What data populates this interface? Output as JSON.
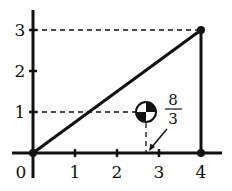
{
  "diagram": {
    "type": "triangle-center-of-mass",
    "x_axis": {
      "ticks": [
        "0",
        "1",
        "2",
        "3",
        "4"
      ]
    },
    "y_axis": {
      "ticks": [
        "1",
        "2",
        "3"
      ]
    },
    "vertices": [
      [
        0,
        0
      ],
      [
        4,
        0
      ],
      [
        4,
        3
      ]
    ],
    "center_of_mass": {
      "x": "8/3",
      "y": 1
    },
    "annotation": {
      "numerator": "8",
      "denominator": "3"
    },
    "colors": {
      "ink": "#111111",
      "background": "#ffffff"
    }
  }
}
